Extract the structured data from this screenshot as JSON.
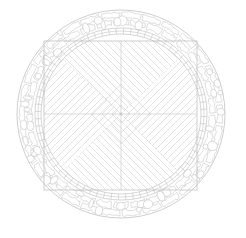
{
  "drawing": {
    "title": "Circular Paved Terrace Plan",
    "caption": "",
    "background_color": "#ffffff",
    "line_color": "#b9b9b9",
    "hatch_color": "#c9c9c9",
    "axis_color": "#c4c4c4",
    "stone_color": "#bdbdbd"
  },
  "geometry": {
    "canvas": {
      "width": 246,
      "height": 238
    },
    "center": {
      "x": 121,
      "y": 114
    },
    "outer_circle": {
      "cx": 121,
      "cy": 114,
      "r": 104,
      "label": "outer-kerb"
    },
    "inner_circle": {
      "cx": 121,
      "cy": 114,
      "r": 86,
      "label": "cobble-ring-inner-edge"
    },
    "paving_circle": {
      "cx": 121,
      "cy": 114,
      "r": 80,
      "label": "paving-field-edge"
    },
    "inscribed_square": {
      "x": 44,
      "y": 41,
      "width": 153,
      "height": 149,
      "label": "terrace-square"
    },
    "central_diamond": {
      "cx": 121,
      "cy": 114,
      "half_diagonal": 9,
      "label": "centre-medallion"
    },
    "hatch_spacing_px": 7,
    "hatch_angle_deg": 45,
    "axis_lines": [
      "horizontal-centreline",
      "vertical-centreline"
    ]
  },
  "layers": [
    {
      "id": "outer-kerb-ring",
      "name": "Outer kerb circle",
      "type": "circle"
    },
    {
      "id": "cobble-ring",
      "name": "Rubble stone ring",
      "type": "irregular-stone-fill"
    },
    {
      "id": "terrace-square",
      "name": "Inscribed square border",
      "type": "rectangle"
    },
    {
      "id": "paver-bands",
      "name": "Corner brick paver bands",
      "type": "brick-courses"
    },
    {
      "id": "diagonal-paving",
      "name": "Mitred 45 deg paving",
      "type": "hatch"
    },
    {
      "id": "centre-axes",
      "name": "Setting-out centrelines",
      "type": "axes"
    }
  ],
  "chart_data": {
    "type": "diagram",
    "elements": [
      {
        "name": "outer circle radius",
        "value": 104,
        "unit": "px"
      },
      {
        "name": "stone ring inner radius",
        "value": 86,
        "unit": "px"
      },
      {
        "name": "paving field radius",
        "value": 80,
        "unit": "px"
      },
      {
        "name": "square side",
        "value": 153,
        "unit": "px"
      },
      {
        "name": "hatch spacing",
        "value": 7,
        "unit": "px"
      },
      {
        "name": "hatch angle",
        "value": 45,
        "unit": "deg"
      }
    ]
  }
}
